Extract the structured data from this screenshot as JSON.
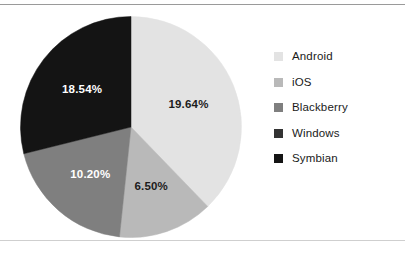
{
  "chart_data": {
    "type": "pie",
    "title": "",
    "subtitle": "",
    "xlabel": "",
    "ylabel": "",
    "legend_position": "right",
    "grid": false,
    "categories": [
      "Android",
      "iOS",
      "Blackberry",
      "Windows",
      "Symbian"
    ],
    "values": [
      19.64,
      6.5,
      10.2,
      null,
      18.54
    ],
    "value_unit": "%",
    "data_labels": [
      "19.64%",
      "6.50%",
      "10.20%",
      "",
      "18.54%"
    ],
    "colors": [
      "#e3e3e3",
      "#b9b9b9",
      "#7f7f7f",
      "#333333",
      "#141414"
    ],
    "slices": [
      {
        "name": "Android",
        "label": "19.64%",
        "color": "#e3e3e3",
        "start_angle": 0,
        "end_angle": 136,
        "label_on_dark": false
      },
      {
        "name": "iOS",
        "label": "6.50%",
        "color": "#b9b9b9",
        "start_angle": 136,
        "end_angle": 186,
        "label_on_dark": false
      },
      {
        "name": "Blackberry",
        "label": "10.20%",
        "color": "#7f7f7f",
        "start_angle": 186,
        "end_angle": 256,
        "label_on_dark": true
      },
      {
        "name": "Symbian",
        "label": "18.54%",
        "color": "#141414",
        "start_angle": 256,
        "end_angle": 360,
        "label_on_dark": true
      }
    ]
  },
  "legend": {
    "items": [
      {
        "label": "Android",
        "color": "#e3e3e3"
      },
      {
        "label": "iOS",
        "color": "#b9b9b9"
      },
      {
        "label": "Blackberry",
        "color": "#7f7f7f"
      },
      {
        "label": "Windows",
        "color": "#333333"
      },
      {
        "label": "Symbian",
        "color": "#141414"
      }
    ]
  }
}
